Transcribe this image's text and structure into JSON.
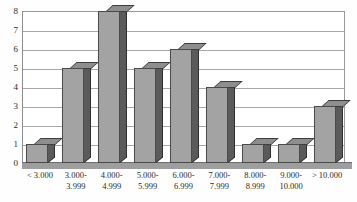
{
  "chart_data": {
    "type": "bar",
    "title": "",
    "subtitle": "",
    "xlabel": "",
    "ylabel": "",
    "ylim": [
      0,
      8
    ],
    "ytick_step": 1,
    "grid": true,
    "legend": false,
    "style": "3d-column",
    "categories": [
      "< 3.000",
      "3.000-\n3.999",
      "4.000-\n4.999",
      "5.000-\n5.999",
      "6.000-\n6.999",
      "7.000-\n7.999",
      "8.000-\n8.999",
      "9.000-\n10.000",
      "> 10.000"
    ],
    "category_lines": [
      [
        "< 3.000"
      ],
      [
        "3.000-",
        "3.999"
      ],
      [
        "4.000-",
        "4.999"
      ],
      [
        "5.000-",
        "5.999"
      ],
      [
        "6.000-",
        "6.999"
      ],
      [
        "7.000-",
        "7.999"
      ],
      [
        "8.000-",
        "8.999"
      ],
      [
        "9.000-",
        "10.000"
      ],
      [
        "> 10.000"
      ]
    ],
    "values": [
      1,
      5,
      8,
      5,
      6,
      4,
      1,
      1,
      3
    ],
    "ytick_labels": [
      "0",
      "1",
      "2",
      "3",
      "4",
      "5",
      "6",
      "7",
      "8"
    ],
    "colors": {
      "bar_front": "#a3a3a3",
      "bar_side": "#5a5a5a",
      "bar_top": "#8e8e8e",
      "bar_outline": "#4a4a4a",
      "gridline": "#a8a8a8",
      "frame": "#8d8d8d",
      "floor": "#9e9e9e",
      "background": "#ffffff",
      "text": "#2b2b2b"
    }
  }
}
